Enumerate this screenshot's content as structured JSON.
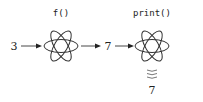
{
  "diagram": {
    "input_value": "3",
    "stages": [
      {
        "label": "f()",
        "icon": "atom-icon"
      },
      {
        "label": "print()",
        "icon": "atom-icon"
      }
    ],
    "intermediate_value": "7",
    "output_value": "7",
    "output_icon": "wavy-lines-icon"
  }
}
